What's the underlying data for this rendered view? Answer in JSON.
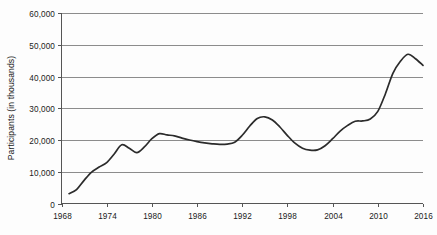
{
  "chart_data": {
    "type": "line",
    "title": "",
    "subtitle": "",
    "xlabel": "",
    "ylabel": "Participants (in thousands)",
    "xlim": [
      1968,
      2016
    ],
    "ylim": [
      0,
      60000
    ],
    "grid": true,
    "legend": false,
    "legend_position": "none",
    "line_color": "#2b2b2b",
    "grid_color": "#8c8c8c",
    "axis_color": "#555555",
    "background_color": "#fdfdfd",
    "y_ticks": [
      0,
      10000,
      20000,
      30000,
      40000,
      50000,
      60000
    ],
    "y_tick_labels": [
      "0",
      "10,000",
      "20,000",
      "30,000",
      "40,000",
      "50,000",
      "60,000"
    ],
    "x_ticks": [
      1968,
      1974,
      1980,
      1986,
      1992,
      1998,
      2004,
      2010,
      2016
    ],
    "x_tick_labels": [
      "1968",
      "1974",
      "1980",
      "1986",
      "1992",
      "1998",
      "2004",
      "2010",
      "2016"
    ],
    "x": [
      1969,
      1970,
      1971,
      1972,
      1973,
      1974,
      1975,
      1976,
      1977,
      1978,
      1979,
      1980,
      1981,
      1982,
      1983,
      1984,
      1985,
      1986,
      1987,
      1988,
      1989,
      1990,
      1991,
      1992,
      1993,
      1994,
      1995,
      1996,
      1997,
      1998,
      1999,
      2000,
      2001,
      2002,
      2003,
      2004,
      2005,
      2006,
      2007,
      2008,
      2009,
      2010,
      2011,
      2012,
      2013,
      2014,
      2015,
      2016
    ],
    "values": [
      3100,
      4400,
      7300,
      9900,
      11500,
      12900,
      15600,
      18500,
      17400,
      16000,
      17800,
      20400,
      22000,
      21600,
      21300,
      20600,
      20000,
      19500,
      19100,
      18800,
      18600,
      18700,
      19300,
      21500,
      24400,
      26800,
      27300,
      26300,
      24100,
      21400,
      19000,
      17400,
      16800,
      16900,
      18200,
      20400,
      22800,
      24600,
      25900,
      26000,
      26600,
      29000,
      34500,
      41000,
      44800,
      47000,
      45600,
      43500
    ]
  },
  "axes": {
    "ylabel": "Participants (in thousands)"
  }
}
